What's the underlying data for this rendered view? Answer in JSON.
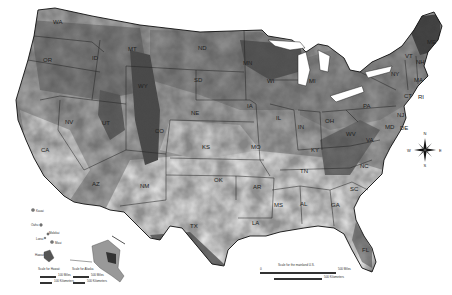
{
  "map": {
    "title": "",
    "background": "#ffffff",
    "palette": [
      "#f0f0f0",
      "#d6d6d6",
      "#b8b8b8",
      "#9a9a9a",
      "#7c7c7c",
      "#5c5c5c",
      "#3a3a3a",
      "#1a1a1a"
    ],
    "state_labels": [
      {
        "abbr": "WA",
        "x": 58,
        "y": 22
      },
      {
        "abbr": "OR",
        "x": 48,
        "y": 60
      },
      {
        "abbr": "ID",
        "x": 97,
        "y": 58
      },
      {
        "abbr": "MT",
        "x": 133,
        "y": 49
      },
      {
        "abbr": "ND",
        "x": 203,
        "y": 48
      },
      {
        "abbr": "MN",
        "x": 248,
        "y": 63
      },
      {
        "abbr": "WI",
        "x": 272,
        "y": 81
      },
      {
        "abbr": "MI",
        "x": 314,
        "y": 81
      },
      {
        "abbr": "SD",
        "x": 199,
        "y": 80
      },
      {
        "abbr": "WY",
        "x": 143,
        "y": 86
      },
      {
        "abbr": "NV",
        "x": 70,
        "y": 122
      },
      {
        "abbr": "UT",
        "x": 107,
        "y": 123
      },
      {
        "abbr": "CO",
        "x": 160,
        "y": 131
      },
      {
        "abbr": "NE",
        "x": 196,
        "y": 113
      },
      {
        "abbr": "IA",
        "x": 252,
        "y": 106
      },
      {
        "abbr": "IL",
        "x": 281,
        "y": 118
      },
      {
        "abbr": "IN",
        "x": 303,
        "y": 127
      },
      {
        "abbr": "OH",
        "x": 330,
        "y": 121
      },
      {
        "abbr": "PA",
        "x": 368,
        "y": 106
      },
      {
        "abbr": "NY",
        "x": 396,
        "y": 74
      },
      {
        "abbr": "VT",
        "x": 410,
        "y": 56
      },
      {
        "abbr": "NH",
        "x": 421,
        "y": 62
      },
      {
        "abbr": "ME",
        "x": 432,
        "y": 42
      },
      {
        "abbr": "MA",
        "x": 419,
        "y": 80
      },
      {
        "abbr": "RI",
        "x": 423,
        "y": 97
      },
      {
        "abbr": "CT",
        "x": 409,
        "y": 96
      },
      {
        "abbr": "NJ",
        "x": 402,
        "y": 115
      },
      {
        "abbr": "DE",
        "x": 405,
        "y": 128
      },
      {
        "abbr": "MD",
        "x": 390,
        "y": 127
      },
      {
        "abbr": "WV",
        "x": 351,
        "y": 134
      },
      {
        "abbr": "VA",
        "x": 371,
        "y": 140
      },
      {
        "abbr": "KY",
        "x": 316,
        "y": 150
      },
      {
        "abbr": "KS",
        "x": 207,
        "y": 147
      },
      {
        "abbr": "MO",
        "x": 256,
        "y": 147
      },
      {
        "abbr": "CA",
        "x": 46,
        "y": 150
      },
      {
        "abbr": "AZ",
        "x": 97,
        "y": 184
      },
      {
        "abbr": "NM",
        "x": 145,
        "y": 186
      },
      {
        "abbr": "OK",
        "x": 219,
        "y": 180
      },
      {
        "abbr": "AR",
        "x": 258,
        "y": 187
      },
      {
        "abbr": "TN",
        "x": 305,
        "y": 171
      },
      {
        "abbr": "NC",
        "x": 365,
        "y": 166
      },
      {
        "abbr": "SC",
        "x": 355,
        "y": 189
      },
      {
        "abbr": "MS",
        "x": 279,
        "y": 205
      },
      {
        "abbr": "AL",
        "x": 305,
        "y": 204
      },
      {
        "abbr": "GA",
        "x": 336,
        "y": 205
      },
      {
        "abbr": "LA",
        "x": 257,
        "y": 223
      },
      {
        "abbr": "TX",
        "x": 195,
        "y": 226
      },
      {
        "abbr": "FL",
        "x": 367,
        "y": 250
      }
    ],
    "compass": {
      "n": "N",
      "s": "S",
      "e": "E",
      "w": "W"
    },
    "hawaii": {
      "islands": [
        "Kauai",
        "Oahu",
        "Molokai",
        "Lanai",
        "Maui",
        "Hawaii"
      ],
      "scale_title": "Scale for Hawaii",
      "miles_label": "100 Miles",
      "km_label": "100 Kilometers",
      "zero": "0"
    },
    "alaska": {
      "scale_title": "Scale for Alaska",
      "miles_label": "500 Miles",
      "km_label": "500 Kilometers",
      "zero": "0"
    },
    "mainland_scale": {
      "title": "Scale for the mainland U.S.",
      "miles_label": "500 Miles",
      "km_label": "500 Kilometers",
      "zero": "0"
    }
  }
}
